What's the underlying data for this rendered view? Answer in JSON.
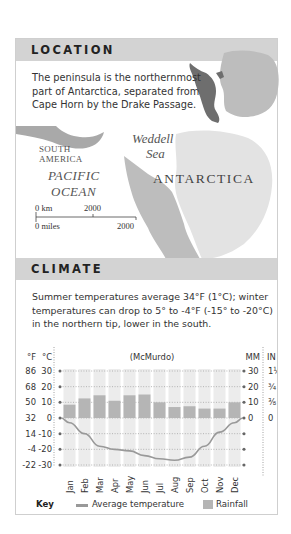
{
  "location": {
    "heading": "LOCATION",
    "description": "The peninsula is the northernmost part of Antarctica, separated from Cape Horn by the Drake Passage.",
    "map_labels": {
      "weddell": "Weddell",
      "sea": "Sea",
      "south": "SOUTH",
      "america": "AMERICA",
      "pacific": "PACIFIC",
      "ocean": "OCEAN",
      "antarctica": "ANTARCTICA",
      "scale_km_start": "0 km",
      "scale_km_end": "2000",
      "scale_mi_start": "0 miles",
      "scale_mi_end": "2000"
    }
  },
  "climate": {
    "heading": "CLIMATE",
    "description": "Summer temperatures average 34°F (1°C); winter temperatures can drop to 5° to -4°F (-15° to -20°C) in the northern tip, lower in the south.",
    "key": {
      "title": "Key",
      "temperature": "Average temperature",
      "rainfall": "Rainfall"
    }
  },
  "chart_data": {
    "type": "bar",
    "title": "(McMurdo)",
    "categories": [
      "Jan",
      "Feb",
      "Mar",
      "Apr",
      "May",
      "Jun",
      "Jul",
      "Aug",
      "Sep",
      "Oct",
      "Nov",
      "Dec"
    ],
    "series": [
      {
        "name": "Rainfall",
        "type": "bar",
        "axis": "right",
        "unit": "MM",
        "values": [
          8.5,
          12.5,
          14.5,
          11,
          14.5,
          15,
          10,
          7,
          7.5,
          6,
          6,
          10
        ]
      },
      {
        "name": "Average temperature",
        "type": "line",
        "axis": "left",
        "unit": "°C",
        "values": [
          -3,
          -10,
          -18,
          -20,
          -21,
          -24,
          -26,
          -27,
          -25,
          -18,
          -9,
          -3
        ]
      }
    ],
    "left_axis": {
      "label_f": "°F",
      "label_c": "°C",
      "ticks_c": [
        30,
        20,
        10,
        0,
        -10,
        -20,
        -30
      ],
      "ticks_f": [
        86,
        68,
        50,
        32,
        14,
        -4,
        -22
      ],
      "range_c": [
        -30,
        30
      ]
    },
    "right_axis": {
      "label_mm": "MM",
      "label_in": "IN",
      "ticks_mm": [
        30,
        20,
        10,
        0
      ],
      "ticks_in": [
        "1¼",
        "¾",
        "⅜",
        "0"
      ],
      "range_mm": [
        0,
        30
      ]
    },
    "grid": true,
    "legend": "bottom"
  },
  "colors": {
    "header_band": "#d3d3d3",
    "bar_fill": "#b5b5b5",
    "column_band": "#ececec",
    "temperature_line": "#999999",
    "peninsula_dark": "#6e6e6e",
    "continent_light": "#bdbdbd"
  }
}
